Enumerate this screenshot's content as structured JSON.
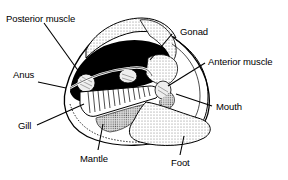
{
  "diagram": {
    "labels": [
      {
        "id": "posterior-muscle",
        "text": "Posterior muscle"
      },
      {
        "id": "gonad",
        "text": "Gonad"
      },
      {
        "id": "anterior-muscle",
        "text": "Anterior muscle"
      },
      {
        "id": "anus",
        "text": "Anus"
      },
      {
        "id": "mouth",
        "text": "Mouth"
      },
      {
        "id": "gill",
        "text": "Gill"
      },
      {
        "id": "mantle",
        "text": "Mantle"
      },
      {
        "id": "foot",
        "text": "Foot"
      }
    ],
    "colors": {
      "ink": "#000000",
      "background": "#ffffff",
      "stipple": "#9a9a9a"
    }
  }
}
